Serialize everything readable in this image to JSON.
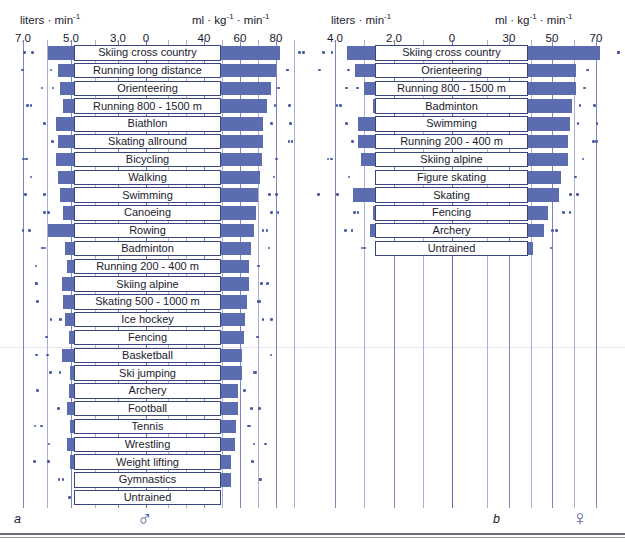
{
  "figure": {
    "bottom_rule": true,
    "bar_color": "#5b6cb0",
    "dot_color": "#4a5aa4",
    "grid_color": "#aab0d4"
  },
  "panels": [
    {
      "id": "a",
      "letter": "a",
      "sex_symbol": "♂",
      "sex": "male",
      "unit_left": "liters · min",
      "unit_left_sup": "-1",
      "unit_right": "ml · kg",
      "unit_right_sup": "-1",
      "unit_right_2": " · min",
      "unit_right_sup2": "-1",
      "left_ticks": [
        "7.0",
        "5.0",
        "3.0",
        "0"
      ],
      "right_ticks": [
        "40",
        "60",
        "80"
      ]
    },
    {
      "id": "b",
      "letter": "b",
      "sex_symbol": "♀",
      "sex": "female",
      "unit_left": "liters · min",
      "unit_left_sup": "-1",
      "unit_right": "ml · kg",
      "unit_right_sup": "-1",
      "unit_right_2": " · min",
      "unit_right_sup2": "-1",
      "left_ticks": [
        "4.0",
        "2.0",
        "0"
      ],
      "right_ticks": [
        "30",
        "50",
        "70"
      ]
    }
  ],
  "chart_data": {
    "type": "bar",
    "subtitle": "Paired horizontal bars: absolute VO2max (left, liters·min⁻¹) and relative VO2max (right, ml·kg⁻¹·min⁻¹)",
    "orientation": "horizontal-diverging",
    "grid": true,
    "legend": "none",
    "panels": [
      {
        "panel": "a",
        "sex": "male",
        "symbol": "♂",
        "xlabel_left": "liters · min⁻¹",
        "xlabel_right": "ml · kg⁻¹ · min⁻¹",
        "xlim_left": [
          0,
          7.5
        ],
        "xlim_right": [
          30,
          90
        ],
        "left_ticks": [
          7.0,
          5.0,
          3.0,
          0
        ],
        "right_ticks": [
          40,
          60,
          80
        ],
        "categories": [
          "Skiing cross country",
          "Running long distance",
          "Orienteering",
          "Running 800 - 1500 m",
          "Biathlon",
          "Skating allround",
          "Bicycling",
          "Walking",
          "Swimming",
          "Canoeing",
          "Rowing",
          "Badminton",
          "Running 200 - 400 m",
          "Skiing alpine",
          "Skating 500 - 1000 m",
          "Ice hockey",
          "Fencing",
          "Basketball",
          "Ski jumping",
          "Archery",
          "Football",
          "Tennis",
          "Wrestling",
          "Weight lifting",
          "Gymnastics",
          "Untrained"
        ],
        "series": [
          {
            "name": "Absolute VO2max (liters · min⁻¹)",
            "units": "L/min",
            "values": [
              5.6,
              5.0,
              4.9,
              4.7,
              5.1,
              5.0,
              5.1,
              5.0,
              4.9,
              4.7,
              5.6,
              4.6,
              4.5,
              4.8,
              4.7,
              4.6,
              4.4,
              4.8,
              4.3,
              4.4,
              4.5,
              4.3,
              4.5,
              4.3,
              3.8,
              3.6
            ]
          },
          {
            "name": "Relative VO2max (ml · kg⁻¹ · min⁻¹)",
            "units": "ml/kg/min",
            "values": [
              82,
              80,
              77,
              75,
              73,
              73,
              72,
              71,
              70,
              69,
              68,
              66,
              65,
              65,
              64,
              63,
              62,
              61,
              61,
              59,
              59,
              58,
              57,
              55,
              55,
              43
            ]
          }
        ]
      },
      {
        "panel": "b",
        "sex": "female",
        "symbol": "♀",
        "xlabel_left": "liters · min⁻¹",
        "xlabel_right": "ml · kg⁻¹ · min⁻¹",
        "xlim_left": [
          0,
          4.5
        ],
        "xlim_right": [
          22,
          78
        ],
        "left_ticks": [
          4.0,
          2.0,
          0
        ],
        "right_ticks": [
          30,
          50,
          70
        ],
        "categories": [
          "Skiing cross country",
          "Orienteering",
          "Running 800 - 1500 m",
          "Badminton",
          "Swimming",
          "Running 200 - 400 m",
          "Skiing alpine",
          "Figure skating",
          "Skating",
          "Fencing",
          "Archery",
          "Untrained"
        ],
        "series": [
          {
            "name": "Absolute VO2max (liters · min⁻¹)",
            "units": "L/min",
            "values": [
              3.6,
              3.3,
              3.0,
              2.7,
              3.2,
              3.2,
              3.1,
              2.6,
              3.4,
              2.7,
              2.8,
              2.3
            ]
          },
          {
            "name": "Relative VO2max (ml · kg⁻¹ · min⁻¹)",
            "units": "ml/kg/min",
            "values": [
              72,
              61,
              61,
              59,
              58,
              57,
              57,
              54,
              53,
              48,
              46,
              41
            ]
          }
        ]
      }
    ]
  }
}
